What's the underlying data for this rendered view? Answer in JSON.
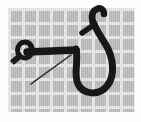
{
  "image": {
    "title": "Fish hook with knotted eye on graph-paper background",
    "subject": "fishing-hook",
    "caption": "Black fish hook and tied line over gray checkered grid",
    "alt_text": "A black fish hook with a barbed point curving upward at right, a straight shank running left, a knotted loop at the left end, and a thin diagonal line of fishing filament, all set against a gray graph-paper grid."
  },
  "background": {
    "type": "grid",
    "cell_color": "#bcbcbc",
    "line_color": "#e6e6e6",
    "cell_size_px": 14,
    "line_width_px": 3,
    "panel_left_px": 8,
    "panel_top_px": 8,
    "panel_width_px": 127,
    "panel_height_px": 104,
    "margin_color": "#fdfdfd"
  },
  "objects": [
    {
      "name": "hook-point-barb",
      "label": "Hook point and barb",
      "color": "#171717",
      "description": "Upward curving spear point at top right of the hook"
    },
    {
      "name": "hook-bend",
      "label": "Hook bend",
      "color": "#171717",
      "description": "Large U-shaped bend sweeping down and around to the right"
    },
    {
      "name": "hook-shank",
      "label": "Hook shank",
      "color": "#171717",
      "description": "Thick horizontal bar running from the knot to the bend"
    },
    {
      "name": "knot-loop",
      "label": "Knotted eye loop",
      "color": "#171717",
      "description": "Round tied loop at the left end of the shank"
    },
    {
      "name": "fishing-line",
      "label": "Fishing line",
      "color": "#2a2a2a",
      "description": "Thin diagonal filament crossing from lower left to upper right"
    }
  ],
  "palette": {
    "ink": "#171717",
    "grid_fill": "#bcbcbc",
    "grid_line": "#e6e6e6",
    "paper": "#fdfdfd"
  }
}
